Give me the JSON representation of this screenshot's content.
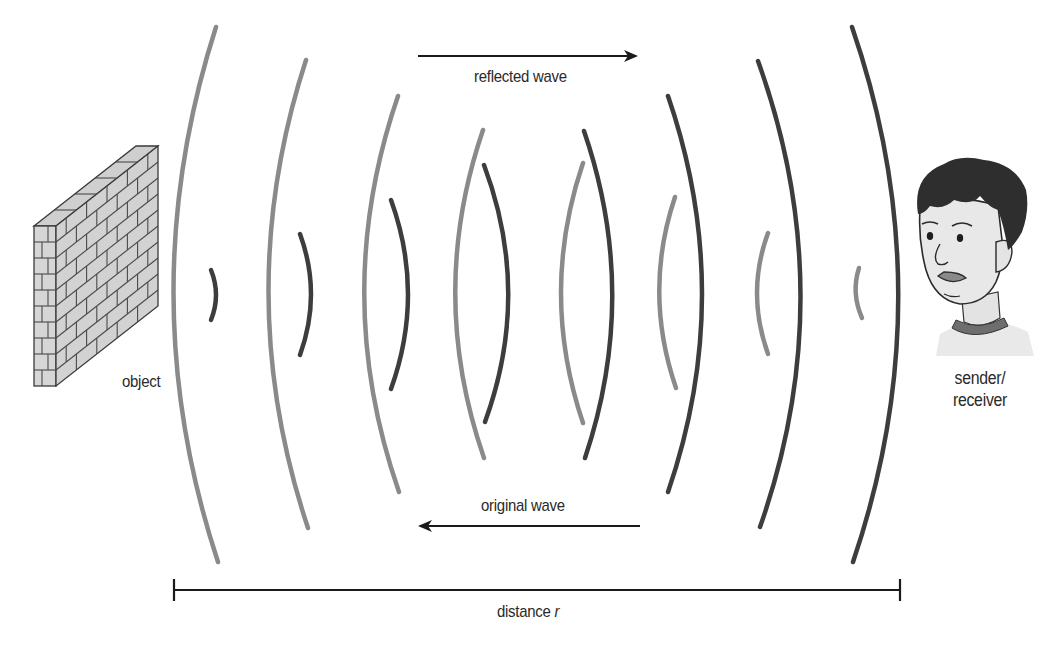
{
  "diagram": {
    "labels": {
      "object": "object",
      "sender_line1": "sender/",
      "sender_line2": "receiver",
      "reflected_wave": "reflected wave",
      "original_wave": "original wave",
      "distance_prefix": "distance ",
      "distance_var": "r"
    },
    "colors": {
      "original_wave": "#8a8a8a",
      "reflected_wave": "#3d3d3d",
      "arrow": "#1a1a1a",
      "brick_face": "#d4d4d4",
      "brick_mortar": "#4a4a4a",
      "hair": "#2e2e2e",
      "skin": "#e6e6e6",
      "collar": "#707070"
    },
    "icons": {
      "object": "brick-wall-icon",
      "sender": "person-head-icon"
    },
    "original_wave_arcs": [
      {
        "x1": 216,
        "y1": 27,
        "cx": 130,
        "cy": 295,
        "x2": 218,
        "y2": 562
      },
      {
        "x1": 306,
        "y1": 60,
        "cx": 230,
        "cy": 294,
        "x2": 308,
        "y2": 528
      },
      {
        "x1": 398,
        "y1": 96,
        "cx": 330,
        "cy": 294,
        "x2": 399,
        "y2": 492
      },
      {
        "x1": 483,
        "y1": 130,
        "cx": 427,
        "cy": 294,
        "x2": 484,
        "y2": 458
      },
      {
        "x1": 583,
        "y1": 163,
        "cx": 539,
        "cy": 293,
        "x2": 583,
        "y2": 423
      },
      {
        "x1": 675,
        "y1": 197,
        "cx": 643,
        "cy": 292,
        "x2": 676,
        "y2": 388
      },
      {
        "x1": 768,
        "y1": 233,
        "cx": 746,
        "cy": 293,
        "x2": 768,
        "y2": 354
      },
      {
        "x1": 859,
        "y1": 268,
        "cx": 851,
        "cy": 293,
        "x2": 862,
        "y2": 318
      }
    ],
    "reflected_wave_arcs": [
      {
        "x1": 211,
        "y1": 270,
        "cx": 221,
        "cy": 295,
        "x2": 211,
        "y2": 320
      },
      {
        "x1": 300,
        "y1": 234,
        "cx": 322,
        "cy": 294,
        "x2": 300,
        "y2": 355
      },
      {
        "x1": 391,
        "y1": 200,
        "cx": 425,
        "cy": 294,
        "x2": 391,
        "y2": 389
      },
      {
        "x1": 484,
        "y1": 165,
        "cx": 532,
        "cy": 293,
        "x2": 485,
        "y2": 422
      },
      {
        "x1": 584,
        "y1": 131,
        "cx": 640,
        "cy": 294,
        "x2": 585,
        "y2": 458
      },
      {
        "x1": 668,
        "y1": 96,
        "cx": 736,
        "cy": 294,
        "x2": 668,
        "y2": 492
      },
      {
        "x1": 758,
        "y1": 61,
        "cx": 842,
        "cy": 294,
        "x2": 760,
        "y2": 527
      },
      {
        "x1": 852,
        "y1": 27,
        "cx": 944,
        "cy": 294,
        "x2": 853,
        "y2": 562
      }
    ],
    "reflected_arrow": {
      "x1": 418,
      "y1": 56,
      "x2": 636,
      "y2": 56,
      "direction": "right"
    },
    "original_arrow": {
      "x1": 640,
      "y1": 526,
      "x2": 420,
      "y2": 526,
      "direction": "left"
    },
    "distance_bar": {
      "x1": 174,
      "x2": 900,
      "y": 590,
      "tick_half": 11
    }
  }
}
